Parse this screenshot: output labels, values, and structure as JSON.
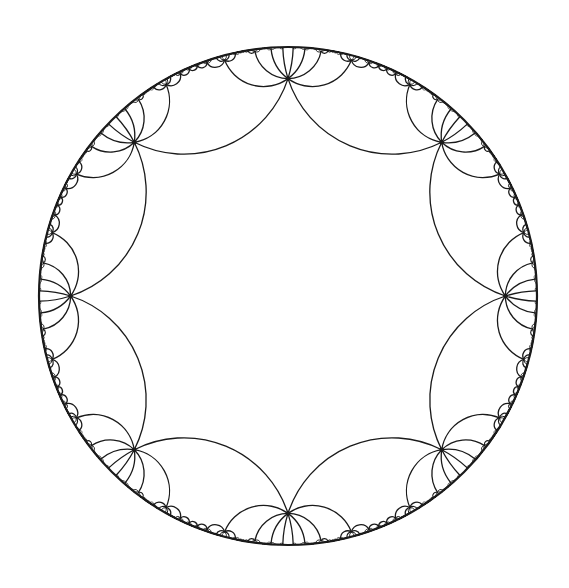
{
  "figure": {
    "title": "Hyperbolic tiling in the Poincaré disk",
    "tiling": {
      "p": 8,
      "q": 8,
      "description": "Regular octagons, eight meeting at each vertex"
    },
    "disk": {
      "cx": 288,
      "cy": 296,
      "radius": 249,
      "boundary_stroke_width": 2.2
    },
    "central_polygon": {
      "sides": 8,
      "vertex_radius_fraction": 0.873,
      "rotation_deg": 22.5
    },
    "style": {
      "background": "#ffffff",
      "stroke": "#1a1a1a",
      "stroke_width": 1.3,
      "vertex_dot_radius": 2.2
    },
    "render": {
      "reflection_depth": 4,
      "min_arc_pixels": 0.6
    }
  }
}
